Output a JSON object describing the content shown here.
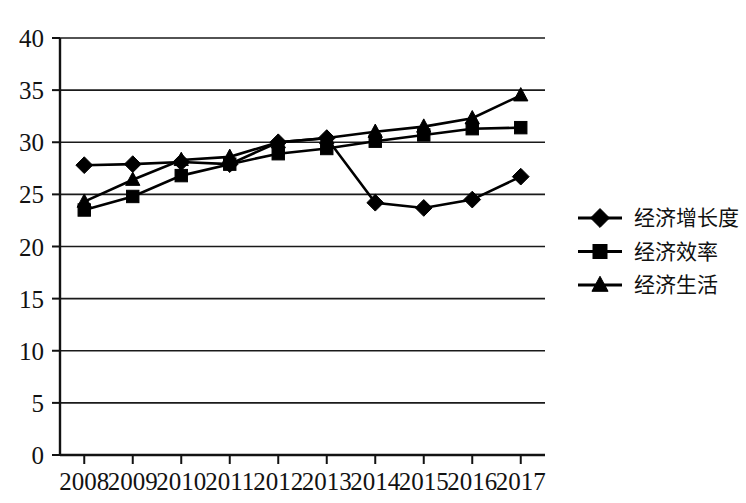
{
  "chart_data": {
    "type": "line",
    "title": "",
    "subtitle": "",
    "xlabel": "",
    "ylabel": "",
    "categories": [
      "2008",
      "2009",
      "2010",
      "2011",
      "2012",
      "2013",
      "2014",
      "2015",
      "2016",
      "2017"
    ],
    "series": [
      {
        "name": "经济增长度",
        "marker": "diamond",
        "values": [
          27.8,
          27.9,
          28.1,
          27.9,
          30.0,
          30.4,
          24.2,
          23.7,
          24.5,
          26.7
        ]
      },
      {
        "name": "经济效率",
        "marker": "square",
        "values": [
          23.5,
          24.8,
          26.8,
          27.9,
          28.9,
          29.4,
          30.1,
          30.7,
          31.3,
          31.4
        ]
      },
      {
        "name": "经济生活",
        "marker": "triangle",
        "values": [
          24.3,
          26.4,
          28.3,
          28.6,
          30.0,
          30.4,
          31.0,
          31.5,
          32.3,
          34.5
        ]
      }
    ],
    "ylim": [
      0,
      40
    ],
    "y_ticks": [
      "0",
      "5",
      "10",
      "15",
      "20",
      "25",
      "30",
      "35",
      "40"
    ],
    "y_tick_values": [
      0,
      5,
      10,
      15,
      20,
      25,
      30,
      35,
      40
    ],
    "grid": true,
    "grid_axis": "y",
    "legend_position": "right",
    "colors": {
      "line": "#000000",
      "marker": "#000000",
      "grid": "#1a1a1a",
      "axis": "#121212",
      "background": "#ffffff",
      "text": "#121212"
    }
  },
  "legend": {
    "entries": [
      {
        "label": "经济增长度",
        "marker": "diamond-marker"
      },
      {
        "label": "经济效率",
        "marker": "square-marker"
      },
      {
        "label": "经济生活",
        "marker": "triangle-marker"
      }
    ]
  }
}
